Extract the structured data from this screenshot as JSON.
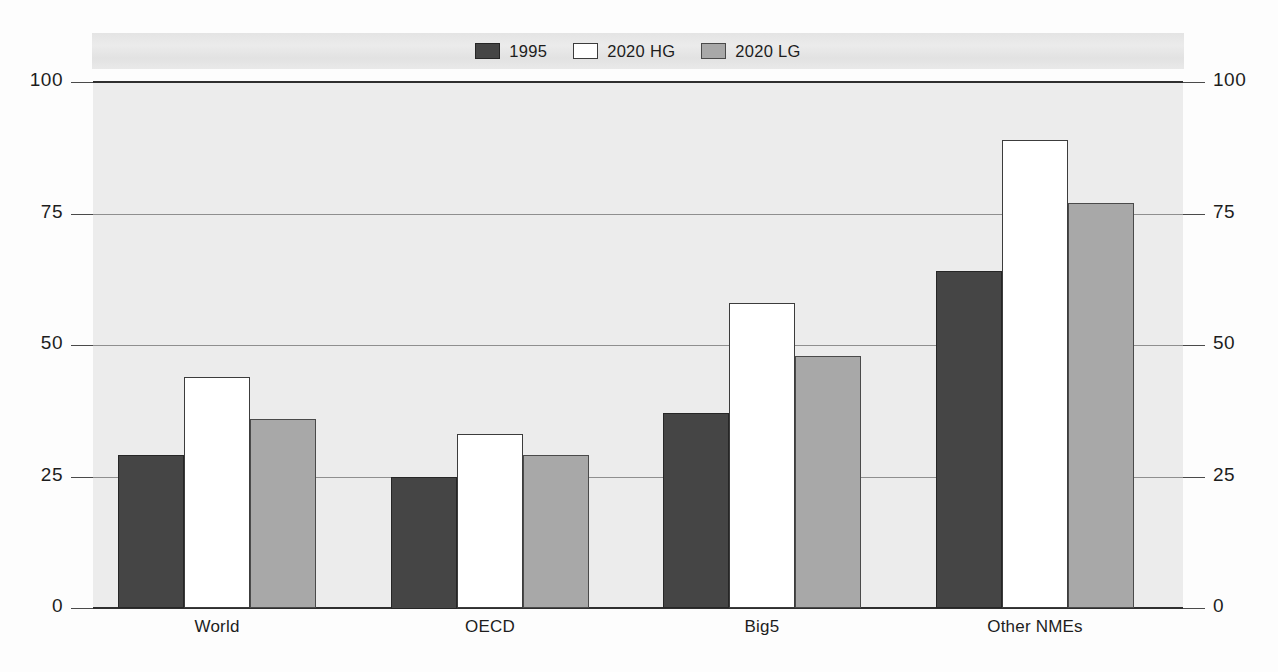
{
  "chart_data": {
    "type": "bar",
    "title": "",
    "subtitle": "",
    "xlabel": "",
    "ylabel": "",
    "categories": [
      "World",
      "OECD",
      "Big5",
      "Other NMEs"
    ],
    "series": [
      {
        "name": "1995",
        "color": "#454545",
        "values": [
          29,
          25,
          37,
          64
        ]
      },
      {
        "name": "2020 HG",
        "color": "#ffffff",
        "values": [
          44,
          33,
          58,
          89
        ]
      },
      {
        "name": "2020 LG",
        "color": "#a8a8a8",
        "values": [
          36,
          29,
          48,
          77
        ]
      }
    ],
    "ylim": [
      0,
      100
    ],
    "yticks": [
      0,
      25,
      50,
      75,
      100
    ],
    "ytick_labels_left": [
      "0",
      "25",
      "50",
      "75",
      "100"
    ],
    "ytick_labels_right": [
      "0",
      "25",
      "50",
      "75",
      "100"
    ],
    "grid": true,
    "grid_axis": "y",
    "legend_position": "top-center",
    "legend_entries": [
      "1995",
      "2020 HG",
      "2020 LG"
    ],
    "plot_background": "#ececec",
    "legend_band_background": "#e6e6e6",
    "axis_color": "#2f2f2f"
  },
  "axis": {
    "left": {
      "t100": "100",
      "t75": "75",
      "t50": "50",
      "t25": "25",
      "t0": "0"
    },
    "right": {
      "t100": "100",
      "t75": "75",
      "t50": "50",
      "t25": "25",
      "t0": "0"
    }
  },
  "legend": {
    "items": [
      {
        "label": "1995"
      },
      {
        "label": "2020 HG"
      },
      {
        "label": "2020 LG"
      }
    ]
  },
  "categories": {
    "c0": "World",
    "c1": "OECD",
    "c2": "Big5",
    "c3": "Other NMEs"
  }
}
